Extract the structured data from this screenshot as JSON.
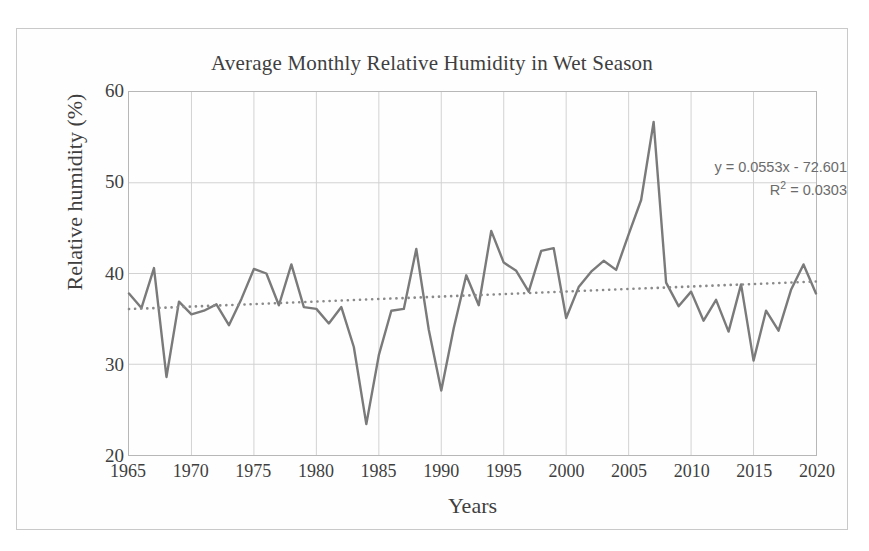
{
  "chart_data": {
    "type": "line",
    "title": "Average Monthly Relative Humidity in Wet Season",
    "xlabel": "Years",
    "ylabel": "Relative humidity (%)",
    "xlim": [
      1965,
      2020
    ],
    "ylim": [
      20,
      60
    ],
    "xticks": [
      1965,
      1970,
      1975,
      1980,
      1985,
      1990,
      1995,
      2000,
      2005,
      2010,
      2015,
      2020
    ],
    "yticks": [
      20,
      30,
      40,
      50,
      60
    ],
    "grid": true,
    "legend": "none",
    "series_color": "#7a7a7a",
    "trend_color": "#8a8a8a",
    "annotations": {
      "equation": "y = 0.0553x - 72.601",
      "r_squared_label": "R",
      "r_squared_sup": "2",
      "r_squared_value": " = 0.0303",
      "r_squared_full": "R² = 0.0303",
      "slope": 0.0553,
      "intercept": -72.601,
      "r2": 0.0303
    },
    "series": [
      {
        "name": "Average monthly relative humidity (wet season)",
        "x": [
          1965,
          1966,
          1967,
          1968,
          1969,
          1970,
          1971,
          1972,
          1973,
          1974,
          1975,
          1976,
          1977,
          1978,
          1979,
          1980,
          1981,
          1982,
          1983,
          1984,
          1985,
          1986,
          1987,
          1988,
          1989,
          1990,
          1991,
          1992,
          1993,
          1994,
          1995,
          1996,
          1997,
          1998,
          1999,
          2000,
          2001,
          2002,
          2003,
          2004,
          2005,
          2006,
          2007,
          2008,
          2009,
          2010,
          2011,
          2012,
          2013,
          2014,
          2015,
          2016,
          2017,
          2018,
          2019,
          2020
        ],
        "values": [
          37.8,
          36.2,
          40.6,
          28.6,
          36.9,
          35.5,
          35.9,
          36.6,
          34.3,
          37.2,
          40.5,
          40.0,
          36.5,
          41.0,
          36.3,
          36.1,
          34.5,
          36.3,
          31.9,
          23.4,
          31.0,
          35.9,
          36.1,
          42.7,
          33.8,
          27.1,
          34.0,
          39.8,
          36.5,
          44.7,
          41.2,
          40.3,
          38.0,
          42.5,
          42.8,
          35.1,
          38.5,
          40.2,
          41.4,
          40.4,
          44.3,
          48.1,
          56.7,
          39.0,
          36.4,
          38.0,
          34.8,
          37.1,
          33.6,
          38.8,
          30.4,
          35.9,
          33.7,
          38.2,
          41.0,
          37.8
        ]
      }
    ],
    "trendline": {
      "name": "Linear trend",
      "style": "dotted",
      "x": [
        1965,
        2020
      ],
      "values": [
        36.08,
        39.12
      ]
    }
  }
}
